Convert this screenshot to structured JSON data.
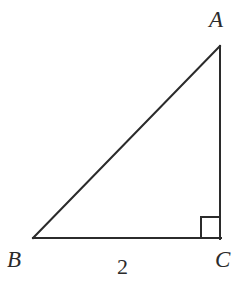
{
  "figure": {
    "kind": "right-triangle-geometry-diagram",
    "background_color": "#ffffff",
    "stroke_color": "#2b2b2b",
    "stroke_width": 2,
    "label_color": "#2b2b2b",
    "vertices": {
      "A": {
        "label": "A",
        "x": 220,
        "y": 46
      },
      "B": {
        "label": "B",
        "x": 33,
        "y": 238
      },
      "C": {
        "label": "C",
        "x": 220,
        "y": 238
      }
    },
    "sides": [
      {
        "name": "hypotenuse-ab",
        "from": "B",
        "to": "A",
        "label": ""
      },
      {
        "name": "leg-bc",
        "from": "B",
        "to": "C",
        "label": "2"
      },
      {
        "name": "leg-ac",
        "from": "A",
        "to": "C",
        "label": ""
      }
    ],
    "right_angle": {
      "at_vertex": "C",
      "marker": "square",
      "size": 20
    },
    "labels": {
      "vertex_a": "A",
      "vertex_b": "B",
      "vertex_c": "C",
      "side_bc": "2"
    }
  }
}
